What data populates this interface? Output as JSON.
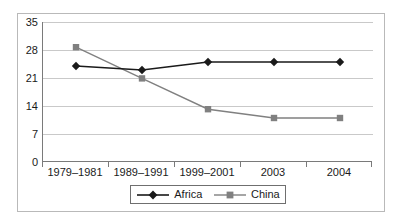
{
  "chart_data": {
    "type": "line",
    "title": "",
    "subtitle": "",
    "xlabel": "",
    "ylabel": "",
    "categories": [
      "1979–1981",
      "1989–1991",
      "1999–2001",
      "2003",
      "2004"
    ],
    "series": [
      {
        "name": "Africa",
        "color": "#1a1a1a",
        "marker": "diamond",
        "values": [
          24.0,
          23.0,
          25.0,
          25.0,
          25.0
        ]
      },
      {
        "name": "China",
        "color": "#808080",
        "marker": "square",
        "values": [
          28.7,
          20.9,
          13.2,
          11.0,
          11.0
        ]
      }
    ],
    "ylim": [
      0,
      35
    ],
    "yticks": [
      0,
      7,
      14,
      21,
      28,
      35
    ],
    "ytick_labels": [
      "0",
      "7",
      "14",
      "21",
      "28",
      "35"
    ],
    "grid": true,
    "grid_axis": "y",
    "legend_position": "bottom",
    "legend_entries": [
      "Africa",
      "China"
    ]
  },
  "legend": {
    "items": [
      {
        "label": "Africa",
        "marker": "diamond-marker",
        "color": "#1a1a1a"
      },
      {
        "label": "China",
        "marker": "square-marker",
        "color": "#808080"
      }
    ]
  },
  "axes": {
    "y_labels": [
      "35",
      "28",
      "21",
      "14",
      "7",
      "0"
    ],
    "x_labels": [
      "1979–1981",
      "1989–1991",
      "1999–2001",
      "2003",
      "2004"
    ]
  }
}
